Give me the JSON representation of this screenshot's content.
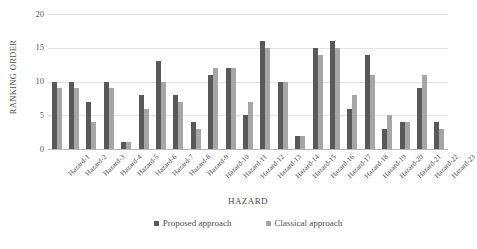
{
  "chart_data": {
    "type": "bar",
    "title": "",
    "xlabel": "HAZARD",
    "ylabel": "RANKING ORDER",
    "ylim": [
      0,
      20
    ],
    "yticks": [
      0,
      5,
      10,
      15,
      20
    ],
    "grid": true,
    "legend_position": "bottom",
    "categories": [
      "Hazard-1",
      "Hazard-2",
      "Hazard-3",
      "Hazard-4",
      "Hazard-5",
      "Hazard-6",
      "Hazard-7",
      "Hazard-8",
      "Hazard-9",
      "Hazard-10",
      "Hazard-11",
      "Hazard-12",
      "Hazard-13",
      "Hazard-14",
      "Hazard-15",
      "Hazard-16",
      "Hazard-17",
      "Hazard-18",
      "Hazard-19",
      "Hazard-20",
      "Hazard-21",
      "Hazard-22",
      "Hazard-23"
    ],
    "series": [
      {
        "name": "Proposed approach",
        "color": "#595959",
        "values": [
          10,
          10,
          7,
          10,
          1,
          8,
          13,
          8,
          4,
          11,
          12,
          5,
          16,
          10,
          2,
          15,
          16,
          6,
          14,
          3,
          4,
          9,
          4
        ]
      },
      {
        "name": "Classical approach",
        "color": "#a6a6a6",
        "values": [
          9,
          9,
          4,
          9,
          1,
          6,
          10,
          7,
          3,
          12,
          12,
          7,
          15,
          10,
          2,
          14,
          15,
          8,
          11,
          5,
          4,
          11,
          3
        ]
      }
    ]
  },
  "colors": {
    "proposed": "#595959",
    "classical": "#a6a6a6",
    "gridline": "#e3e3e3",
    "axis": "#b8b8b8",
    "text": "#4d4d4d"
  }
}
